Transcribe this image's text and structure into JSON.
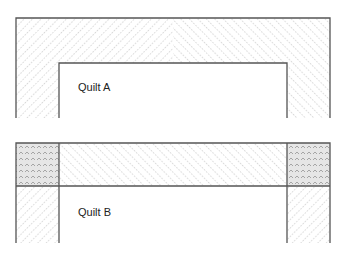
{
  "figures": [
    {
      "label": "Quilt A",
      "description": "Mitered border: top band hatched with chevron diagonals meeting at center, side strips continue hatch"
    },
    {
      "label": "Quilt B",
      "description": "Border with cornerstones: shaded crosshatched corner squares, straight diagonal hatch on top band and side strips"
    }
  ],
  "colors": {
    "line": "#555555",
    "hatch": "#9a9a9a",
    "cornerstone_fill": "#e6e6e6"
  }
}
